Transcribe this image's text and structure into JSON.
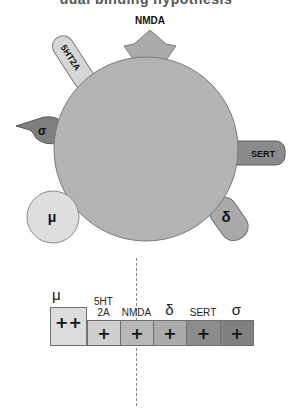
{
  "title": "dual binding hypothesis",
  "diagram": {
    "center_body_color": "#b3b3b3",
    "receptors": [
      {
        "id": "nmda",
        "label": "NMDA",
        "shape": "crown",
        "color": "#ababab"
      },
      {
        "id": "5ht2a",
        "label": "5HT2A",
        "shape": "rounded-tab",
        "color": "#d6d6d6"
      },
      {
        "id": "sigma",
        "label": "σ",
        "shape": "beak",
        "color": "#7f7f7f"
      },
      {
        "id": "mu",
        "label": "μ",
        "shape": "circle",
        "color": "#dedede"
      },
      {
        "id": "sert",
        "label": "SERT",
        "shape": "rounded-tab",
        "color": "#8a8a8a"
      },
      {
        "id": "delta",
        "label": "δ",
        "shape": "rounded-tab",
        "color": "#a9a9a9"
      }
    ]
  },
  "affinity_table": {
    "columns": [
      {
        "header": "μ",
        "value": "++",
        "color": "#dcdcdc"
      },
      {
        "header": "5HT 2A",
        "header_line1": "5HT",
        "header_line2": "2A",
        "value": "+",
        "color": "#cfcfcf"
      },
      {
        "header": "NMDA",
        "value": "+",
        "color": "#b8b8b8"
      },
      {
        "header": "δ",
        "value": "+",
        "color": "#ababab"
      },
      {
        "header": "SERT",
        "value": "+",
        "color": "#8c8c8c"
      },
      {
        "header": "σ",
        "value": "+",
        "color": "#818181"
      }
    ]
  }
}
